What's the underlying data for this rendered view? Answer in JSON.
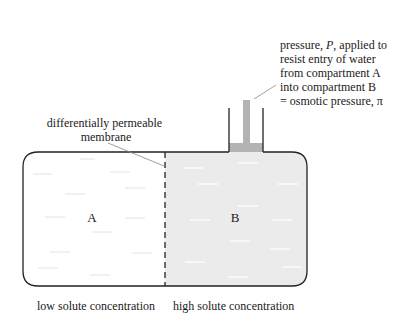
{
  "diagram": {
    "pressure_annotation": {
      "lines": [
        "pressure, ",
        "resist entry of water",
        "from compartment A",
        "into compartment B",
        "= osmotic pressure, π"
      ],
      "line1_prefix": "pressure, ",
      "line1_italic": "P",
      "line1_suffix": ", applied to"
    },
    "membrane_label": {
      "line1": "differentially permeable",
      "line2": "membrane"
    },
    "compartments": [
      {
        "id": "A",
        "label": "A",
        "caption": "low solute concentration",
        "fill": "#ffffff"
      },
      {
        "id": "B",
        "label": "B",
        "caption": "high solute concentration",
        "fill": "#ebebeb"
      }
    ],
    "colors": {
      "outline": "#222222",
      "solution_b": "#ebebeb",
      "piston_column": "#b3b3b3",
      "water_dash_a": "#e2e2e2",
      "water_dash_b": "#ffffff",
      "leader_line": "#888888"
    }
  }
}
